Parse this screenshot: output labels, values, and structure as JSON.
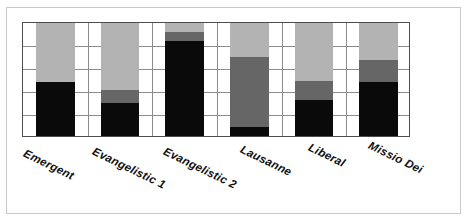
{
  "chart_data": {
    "type": "bar",
    "title": "",
    "subtitle": "",
    "xlabel": "",
    "ylabel": "",
    "stacked": true,
    "grid": true,
    "legend": "none",
    "ylim": [
      0,
      100
    ],
    "y_gridline_count": 5,
    "categories": [
      "Emergent",
      "Evangelistic 1",
      "Evangelistic 2",
      "Lausanne",
      "Liberal",
      "Missio Dei"
    ],
    "series": [
      {
        "name": "Series 1",
        "color": "#0a0a0a",
        "values": [
          48,
          29,
          84,
          8,
          32,
          48
        ]
      },
      {
        "name": "Series 2",
        "color": "#666666",
        "values": [
          0,
          12,
          8,
          62,
          17,
          19
        ]
      },
      {
        "name": "Series 3",
        "color": "#b3b3b3",
        "values": [
          52,
          59,
          8,
          30,
          51,
          33
        ]
      }
    ],
    "annotations": [],
    "tick_labels": []
  },
  "figure": {
    "background_color": "#ffffff",
    "frame_color": "#c9c9c9",
    "plot_border_color": "#4d4d4d",
    "gridline_color": "#8c8c8c"
  },
  "labels": {
    "rotation_degrees": 26,
    "positions": [
      {
        "text": "Emergent",
        "x": 27,
        "y": 10
      },
      {
        "text": "Evangelistic 1",
        "x": 96,
        "y": 8
      },
      {
        "text": "Evangelistic 2",
        "x": 167,
        "y": 8
      },
      {
        "text": "Lausanne",
        "x": 244,
        "y": 6
      },
      {
        "text": "Liberal",
        "x": 312,
        "y": 4
      },
      {
        "text": "Missio Dei",
        "x": 372,
        "y": 2
      }
    ]
  }
}
